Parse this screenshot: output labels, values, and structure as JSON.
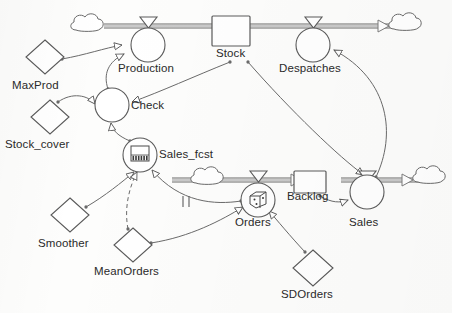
{
  "diagram": {
    "type": "system-dynamics-stock-flow",
    "stocks": [
      {
        "id": "stock",
        "label": "Stock",
        "x": 231,
        "y": 31,
        "w": 38,
        "h": 30,
        "label_x": 217,
        "label_y": 52
      },
      {
        "id": "backlog",
        "label": "Backlog",
        "x": 309,
        "y": 182,
        "w": 32,
        "h": 21,
        "label_x": 288,
        "label_y": 198
      }
    ],
    "flows": [
      {
        "id": "production",
        "label": "Production",
        "cx": 148,
        "cy": 45,
        "r": 17,
        "label_x": 119,
        "label_y": 67,
        "icon": "none"
      },
      {
        "id": "despatches",
        "label": "Despatches",
        "cx": 313,
        "cy": 45,
        "r": 17,
        "label_x": 281,
        "label_y": 67,
        "icon": "none"
      },
      {
        "id": "orders",
        "label": "Orders",
        "cx": 258,
        "cy": 200,
        "r": 17,
        "label_x": 236,
        "label_y": 224,
        "icon": "dice-icon"
      },
      {
        "id": "sales",
        "label": "Sales",
        "cx": 367,
        "cy": 192,
        "r": 17,
        "label_x": 350,
        "label_y": 224,
        "icon": "none"
      }
    ],
    "auxiliaries": [
      {
        "id": "check",
        "label": "Check",
        "cx": 112,
        "cy": 105,
        "r": 17,
        "label_x": 130,
        "label_y": 108,
        "icon": "none"
      },
      {
        "id": "sales_fcst",
        "label": "Sales_fcst",
        "cx": 140,
        "cy": 155,
        "r": 17,
        "label_x": 159,
        "label_y": 155,
        "icon": "histogram-icon"
      }
    ],
    "constants": [
      {
        "id": "maxprod",
        "label": "MaxProd",
        "cx": 45,
        "cy": 57,
        "rx": 19,
        "ry": 17,
        "label_x": 14,
        "label_y": 87
      },
      {
        "id": "stock_cover",
        "label": "Stock_cover",
        "cx": 50,
        "cy": 117,
        "rx": 19,
        "ry": 17,
        "label_x": 6,
        "label_y": 147
      },
      {
        "id": "smoother",
        "label": "Smoother",
        "cx": 70,
        "cy": 215,
        "rx": 19,
        "ry": 17,
        "label_x": 40,
        "label_y": 245
      },
      {
        "id": "meanorders",
        "label": "MeanOrders",
        "cx": 133,
        "cy": 245,
        "rx": 19,
        "ry": 17,
        "label_x": 96,
        "label_y": 274
      },
      {
        "id": "sdorders",
        "label": "SDOrders",
        "cx": 313,
        "cy": 268,
        "rx": 20,
        "ry": 18,
        "label_x": 282,
        "label_y": 297
      }
    ],
    "clouds": [
      {
        "id": "cloud-production-source",
        "cx": 90,
        "cy": 27
      },
      {
        "id": "cloud-despatches-sink",
        "cx": 406,
        "cy": 25
      },
      {
        "id": "cloud-orders-source",
        "cx": 210,
        "cy": 179
      },
      {
        "id": "cloud-sales-sink",
        "cx": 430,
        "cy": 178
      }
    ],
    "pipes": [
      {
        "id": "pipe-production-to-stock",
        "from": "cloud-production-source",
        "to": "stock",
        "y": 26
      },
      {
        "id": "pipe-stock-to-despatches",
        "from": "stock",
        "to": "cloud-despatches-sink",
        "y": 26
      },
      {
        "id": "pipe-orders-to-backlog",
        "from": "cloud-orders-source",
        "to": "backlog",
        "y": 180
      },
      {
        "id": "pipe-backlog-to-sales",
        "from": "backlog",
        "to": "cloud-sales-sink",
        "y": 180
      }
    ],
    "links": [
      {
        "id": "link-maxprod-production",
        "from": "MaxProd",
        "to": "Production",
        "style": "solid"
      },
      {
        "id": "link-check-production",
        "from": "Check",
        "to": "Production",
        "style": "solid"
      },
      {
        "id": "link-stock-check",
        "from": "Stock",
        "to": "Check",
        "style": "solid"
      },
      {
        "id": "link-stock_cover-check",
        "from": "Stock_cover",
        "to": "Check",
        "style": "solid"
      },
      {
        "id": "link-sales_fcst-check",
        "from": "Sales_fcst",
        "to": "Check",
        "style": "solid"
      },
      {
        "id": "link-smoother-sales_fcst",
        "from": "Smoother",
        "to": "Sales_fcst",
        "style": "solid"
      },
      {
        "id": "link-meanorders-sales_fcst",
        "from": "MeanOrders",
        "to": "Sales_fcst",
        "style": "dashed"
      },
      {
        "id": "link-orders-sales_fcst",
        "from": "Orders",
        "to": "Sales_fcst",
        "style": "solid",
        "marker": "delay"
      },
      {
        "id": "link-meanorders-orders",
        "from": "MeanOrders",
        "to": "Orders",
        "style": "solid"
      },
      {
        "id": "link-sdorders-orders",
        "from": "SDOrders",
        "to": "Orders",
        "style": "solid"
      },
      {
        "id": "link-backlog-sales",
        "from": "Backlog",
        "to": "Sales",
        "style": "solid"
      },
      {
        "id": "link-stock-sales",
        "from": "Stock",
        "to": "Sales",
        "style": "solid"
      },
      {
        "id": "link-sales-despatches",
        "from": "Sales",
        "to": "Despatches",
        "style": "solid"
      }
    ],
    "labels": {
      "maxprod": "MaxProd",
      "stock_cover": "Stock_cover",
      "smoother": "Smoother",
      "meanorders": "MeanOrders",
      "sdorders": "SDOrders",
      "production": "Production",
      "despatches": "Despatches",
      "check": "Check",
      "sales_fcst": "Sales_fcst",
      "orders": "Orders",
      "sales": "Sales",
      "stock": "Stock",
      "backlog": "Backlog"
    },
    "colors": {
      "stroke": "#5a5a5a",
      "pipe": "#8c8c8c",
      "text": "#2a2a2a",
      "background": "#fdfdfc",
      "icon": "#4a4a4a"
    }
  }
}
